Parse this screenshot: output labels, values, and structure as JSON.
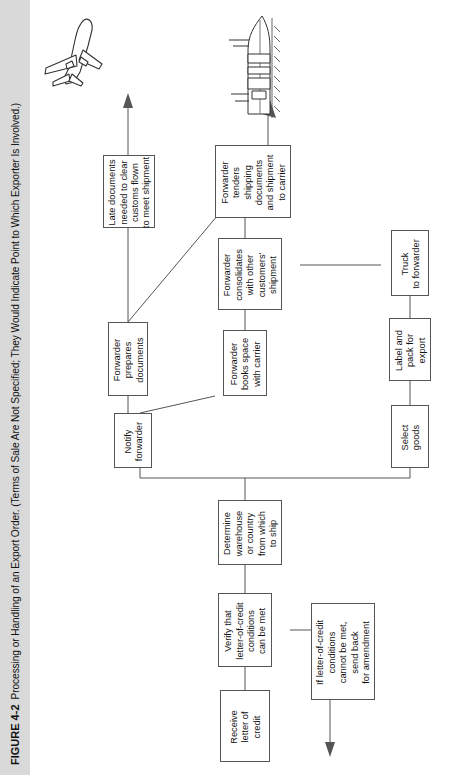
{
  "figure": {
    "number": "FIGURE 4-2",
    "caption": "Processing or Handling of an Export Order. (Terms of Sale Are Not Specified; They Would Indicate Point to Which Exporter Is Involved.)",
    "orientation": "rotated-90-ccw",
    "background": "#ffffff",
    "caption_strip_color": "#d9d9d9",
    "box_border_color": "#555555",
    "line_color": "#555555"
  },
  "flow": {
    "nodes": [
      {
        "id": "receive_loc",
        "label": "Receive\nletter of\ncredit"
      },
      {
        "id": "verify_loc",
        "label": "Verify that\nletter-of-credit\nconditions\ncan be met"
      },
      {
        "id": "amendment",
        "label": "If letter-of-credit\nconditions\ncannot be met,\nsend back\nfor amendment"
      },
      {
        "id": "determine_warehouse",
        "label": "Determine\nwarehouse\nor country\nfrom which\nto ship"
      },
      {
        "id": "notify_forwarder",
        "label": "Notify\nforwarder"
      },
      {
        "id": "select_goods",
        "label": "Select\ngoods"
      },
      {
        "id": "label_pack",
        "label": "Label and\npack for\nexport"
      },
      {
        "id": "truck_forwarder",
        "label": "Truck\nto forwarder"
      },
      {
        "id": "forwarder_prepares",
        "label": "Forwarder\nprepares\ndocuments"
      },
      {
        "id": "books_space",
        "label": "Forwarder\nbooks space\nwith carrier"
      },
      {
        "id": "consolidates",
        "label": "Forwarder\nconsolidates\nwith other\ncustomers'\nshipment"
      },
      {
        "id": "tenders",
        "label": "Forwarder\ntenders\nshipping\ndocuments\nand shipment\nto carrier"
      },
      {
        "id": "late_documents",
        "label": "Late documents\nneeded to clear\ncustoms flown\nto meet shipment"
      }
    ],
    "illustrations": [
      {
        "id": "airplane",
        "name": "airplane-illustration"
      },
      {
        "id": "ship",
        "name": "ship-illustration"
      }
    ]
  }
}
